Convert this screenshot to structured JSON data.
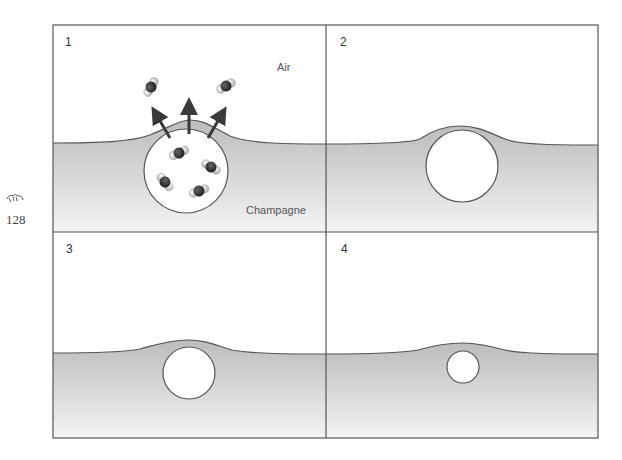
{
  "page": {
    "page_number": "128",
    "ornament_icon": "flourish-ornament-icon"
  },
  "figure": {
    "colors": {
      "frame": "#555555",
      "liquid_top": "#bdbdbd",
      "liquid_bottom": "#f3f3f3",
      "bubble_fill": "#ffffff",
      "molecule_carbon": "#2a2a2a",
      "molecule_oxygen": "#d9d9d9",
      "arrow": "#444444"
    },
    "panels": [
      {
        "number": "1",
        "air_label": "Air",
        "liquid_label": "Champagne",
        "description": "CO2 bubble at surface releasing molecules into air"
      },
      {
        "number": "2",
        "description": "Large bubble under raised surface"
      },
      {
        "number": "3",
        "description": "Medium bubble under surface"
      },
      {
        "number": "4",
        "description": "Small bubble under surface"
      }
    ]
  }
}
